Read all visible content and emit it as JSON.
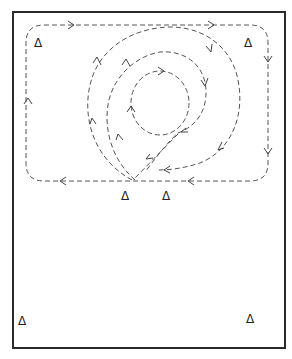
{
  "diagram": {
    "title": "",
    "colors": {
      "frame": "#2a2a2a",
      "path": "#555555",
      "background": "#ffffff"
    },
    "marker_glyph": "Δ",
    "markers": [
      {
        "id": "cone-top-left",
        "label": "Δ",
        "x": 40,
        "y": 47
      },
      {
        "id": "cone-top-right",
        "label": "Δ",
        "x": 250,
        "y": 47
      },
      {
        "id": "cone-center-left",
        "label": "Δ",
        "x": 127,
        "y": 200
      },
      {
        "id": "cone-center-right",
        "label": "Δ",
        "x": 168,
        "y": 200
      },
      {
        "id": "cone-bottom-left",
        "label": "Δ",
        "x": 24,
        "y": 325
      },
      {
        "id": "cone-bottom-right",
        "label": "Δ",
        "x": 252,
        "y": 323
      }
    ],
    "paths": [
      {
        "name": "outer-track",
        "direction": "clockwise"
      },
      {
        "name": "large-spiral",
        "direction": "clockwise"
      },
      {
        "name": "middle-spiral",
        "direction": "clockwise"
      },
      {
        "name": "inner-circle",
        "direction": "clockwise"
      }
    ]
  }
}
